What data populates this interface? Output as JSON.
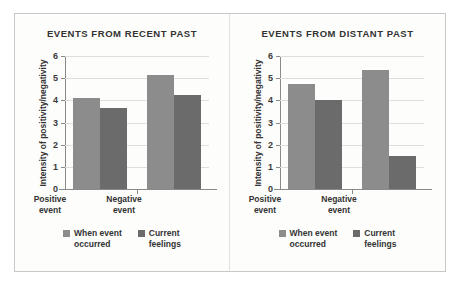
{
  "chart_data": [
    {
      "type": "bar",
      "title": "EVENTS FROM RECENT PAST",
      "xlabel": "",
      "ylabel": "Intensity of positivity/negativity",
      "ylim": [
        0,
        6
      ],
      "yticks": [
        0,
        1,
        2,
        3,
        4,
        5,
        6
      ],
      "grid": true,
      "legend_position": "bottom",
      "categories": [
        "Positive event",
        "Negative event"
      ],
      "category_lines": [
        [
          "Positive",
          "event"
        ],
        [
          "Negative",
          "event"
        ]
      ],
      "series": [
        {
          "name": "When event occurred",
          "values": [
            4.1,
            5.15
          ],
          "color": "#8c8c8c"
        },
        {
          "name": "Current feelings",
          "values": [
            3.65,
            4.25
          ],
          "color": "#6b6b6b"
        }
      ]
    },
    {
      "type": "bar",
      "title": "EVENTS FROM DISTANT PAST",
      "xlabel": "",
      "ylabel": "Intensity of positivity/negativity",
      "ylim": [
        0,
        6
      ],
      "yticks": [
        0,
        1,
        2,
        3,
        4,
        5,
        6
      ],
      "grid": true,
      "legend_position": "bottom",
      "categories": [
        "Positive event",
        "Negative event"
      ],
      "category_lines": [
        [
          "Positive",
          "event"
        ],
        [
          "Negative",
          "event"
        ]
      ],
      "series": [
        {
          "name": "When event occurred",
          "values": [
            4.75,
            5.35
          ],
          "color": "#8c8c8c"
        },
        {
          "name": "Current feelings",
          "values": [
            4.0,
            1.5
          ],
          "color": "#6b6b6b"
        }
      ]
    }
  ],
  "legend": {
    "items": [
      {
        "line1": "When event",
        "line2": "occurred"
      },
      {
        "line1": "Current",
        "line2": "feelings"
      }
    ]
  },
  "colors": {
    "series_light": "#8c8c8c",
    "series_dark": "#6b6b6b",
    "grid": "#dededc",
    "axis": "#8a8a88",
    "text": "#333333",
    "card_background": "#fdfdfc",
    "card_border": "#c8c8c6"
  }
}
